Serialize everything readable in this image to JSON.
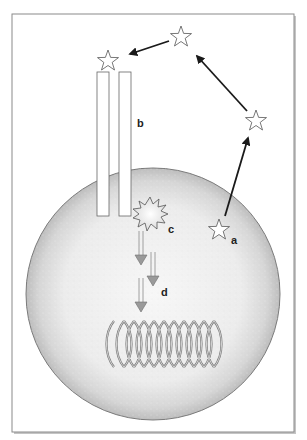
{
  "diagram": {
    "type": "cell-signaling",
    "colors": {
      "frame": "#8a8a8a",
      "frame_shadow": "#b8b8b8",
      "cell_fill_center": "#f6f6f6",
      "cell_fill_edge": "#c8c8c8",
      "cell_outline": "#7a7a7a",
      "arrow_black": "#1a1a1a",
      "arrow_gray": "#8c8c8c",
      "star_stroke": "#555555",
      "helix_stroke": "#7a7a7a"
    },
    "labels": {
      "a": "a",
      "b": "b",
      "c": "c",
      "d": "d"
    },
    "elements": [
      {
        "id": "a",
        "kind": "star",
        "description": "signal molecule inside cell"
      },
      {
        "id": "b",
        "kind": "receptor",
        "description": "membrane receptor (two parallel bars)"
      },
      {
        "id": "c",
        "kind": "burst",
        "description": "activated intracellular signal"
      },
      {
        "id": "d",
        "kind": "arrows",
        "description": "signal cascade to DNA"
      },
      {
        "id": "dna",
        "kind": "helix",
        "description": "DNA double helix"
      }
    ],
    "pathway": [
      "star a",
      "star right",
      "star top",
      "star at receptor"
    ]
  }
}
